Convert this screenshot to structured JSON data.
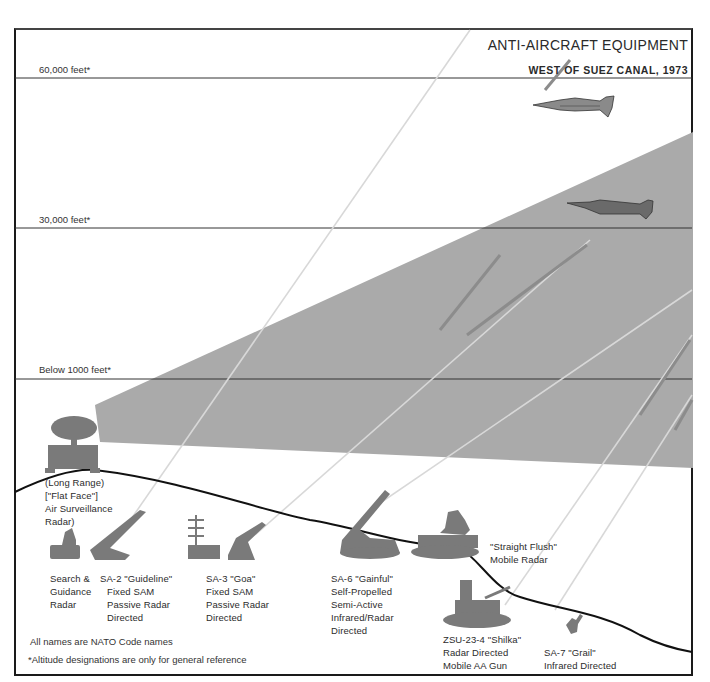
{
  "header": {
    "title": "ANTI-AIRCRAFT EQUIPMENT",
    "subtitle": "WEST OF SUEZ CANAL, 1973"
  },
  "altitudes": [
    {
      "label": "60,000 feet*",
      "y": 78
    },
    {
      "label": "30,000 feet*",
      "y": 228
    },
    {
      "label": "Below 1000 feet*",
      "y": 378
    }
  ],
  "equipment": {
    "flat_face": [
      "(Long Range)",
      "[\"Flat Face\"]",
      "Air Surveillance",
      "Radar)"
    ],
    "search_radar": [
      "Search &",
      "Guidance",
      "Radar"
    ],
    "sa2": [
      "SA-2 \"Guideline\"",
      "Fixed SAM",
      "Passive Radar",
      "Directed"
    ],
    "sa3": [
      "SA-3 \"Goa\"",
      "Fixed SAM",
      "Passive Radar",
      "Directed"
    ],
    "sa6": [
      "SA-6 \"Gainful\"",
      "Self-Propelled",
      "Semi-Active",
      "Infrared/Radar",
      "Directed"
    ],
    "straight_flush": [
      "\"Straight Flush\"",
      "Mobile Radar"
    ],
    "zsu": [
      "ZSU-23-4 \"Shilka\"",
      "Radar Directed",
      "Mobile AA Gun"
    ],
    "sa7": [
      "SA-7 \"Grail\"",
      "Infrared Directed"
    ]
  },
  "notes": {
    "nato": "All names are NATO Code names",
    "altitude": "*Altitude designations are only for general reference"
  },
  "colors": {
    "coverage_gray": "#a8a8a8",
    "equipment_gray": "#777777",
    "aircraft_gray": "#8a8a8a",
    "line": "#1a1a1a"
  }
}
